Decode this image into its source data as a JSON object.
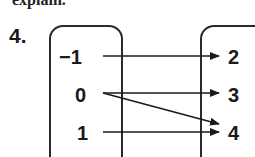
{
  "header": {
    "cut_text": "explain."
  },
  "question": {
    "number": "4."
  },
  "mapping": {
    "domain": [
      "−1",
      "0",
      "1"
    ],
    "range": [
      "2",
      "3",
      "4"
    ],
    "arrows": [
      {
        "from": "−1",
        "to": "2"
      },
      {
        "from": "0",
        "to": "3"
      },
      {
        "from": "0",
        "to": "4"
      },
      {
        "from": "1",
        "to": "4"
      }
    ]
  }
}
